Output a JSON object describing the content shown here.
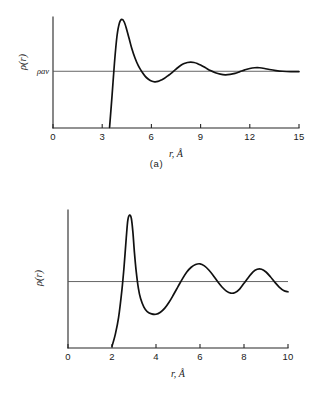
{
  "figure": {
    "panels": [
      {
        "id": "a",
        "caption": "(a)",
        "xlabel": "r, Å",
        "ylabel": "ρ(r)",
        "baseline_label": "ρav",
        "xticks": [
          "0",
          "3",
          "6",
          "9",
          "12",
          "15"
        ]
      },
      {
        "id": "b",
        "caption": "(b)",
        "xlabel": "r, Å",
        "ylabel": "ρ(r)",
        "baseline_label": "",
        "xticks": [
          "0",
          "2",
          "4",
          "6",
          "8",
          "10"
        ]
      }
    ]
  },
  "chart_data": [
    {
      "type": "line",
      "id": "a",
      "title": "",
      "xlabel": "r, Å",
      "ylabel": "ρ(r)",
      "xlim": [
        0,
        15
      ],
      "ylim": [
        -0.62,
        2.55
      ],
      "xticks": [
        0,
        3,
        6,
        9,
        12,
        15
      ],
      "grid": false,
      "legend": null,
      "annotations": [
        {
          "text": "ρav",
          "x": 0,
          "y": 1.0,
          "note": "average density baseline label on y-axis"
        }
      ],
      "baseline_y": 1.0,
      "series": [
        {
          "name": "ρ(r) amorphous",
          "x": [
            3.45,
            3.6,
            3.75,
            3.9,
            4.05,
            4.2,
            4.35,
            4.5,
            4.65,
            4.8,
            5.0,
            5.2,
            5.4,
            5.6,
            5.8,
            6.0,
            6.2,
            6.4,
            6.6,
            6.8,
            7.0,
            7.2,
            7.4,
            7.6,
            7.8,
            8.0,
            8.2,
            8.4,
            8.6,
            8.8,
            9.0,
            9.3,
            9.6,
            9.9,
            10.2,
            10.5,
            10.8,
            11.1,
            11.4,
            11.7,
            12.0,
            12.3,
            12.6,
            12.9,
            13.2,
            13.6,
            14.0,
            14.5,
            15.0
          ],
          "y": [
            -0.6,
            0.3,
            1.25,
            2.0,
            2.38,
            2.48,
            2.4,
            2.18,
            1.92,
            1.66,
            1.38,
            1.16,
            1.0,
            0.87,
            0.78,
            0.72,
            0.7,
            0.71,
            0.75,
            0.8,
            0.87,
            0.94,
            1.02,
            1.1,
            1.17,
            1.22,
            1.25,
            1.26,
            1.25,
            1.22,
            1.18,
            1.1,
            1.02,
            0.96,
            0.92,
            0.9,
            0.91,
            0.94,
            0.99,
            1.04,
            1.08,
            1.1,
            1.1,
            1.08,
            1.05,
            1.02,
            1.0,
            0.99,
            0.99
          ]
        }
      ]
    },
    {
      "type": "line",
      "id": "b",
      "title": "",
      "xlabel": "r, Å",
      "ylabel": "ρ(r)",
      "xlim": [
        0,
        10
      ],
      "ylim": [
        -0.95,
        3.1
      ],
      "xticks": [
        0,
        2,
        4,
        6,
        8,
        10
      ],
      "grid": false,
      "legend": null,
      "annotations": [],
      "baseline_y": 1.0,
      "series": [
        {
          "name": "ρ(r) liquid",
          "x": [
            2.0,
            2.15,
            2.3,
            2.45,
            2.55,
            2.65,
            2.72,
            2.8,
            2.88,
            2.95,
            3.02,
            3.1,
            3.2,
            3.3,
            3.45,
            3.6,
            3.8,
            4.0,
            4.2,
            4.4,
            4.6,
            4.8,
            5.0,
            5.2,
            5.4,
            5.6,
            5.8,
            6.0,
            6.2,
            6.4,
            6.6,
            6.8,
            7.0,
            7.2,
            7.4,
            7.6,
            7.8,
            8.0,
            8.2,
            8.4,
            8.6,
            8.8,
            9.0,
            9.2,
            9.4,
            9.6,
            9.8,
            10.0
          ],
          "y": [
            -0.9,
            -0.55,
            -0.05,
            0.75,
            1.45,
            2.3,
            2.8,
            2.95,
            2.85,
            2.45,
            1.85,
            1.3,
            0.8,
            0.5,
            0.25,
            0.12,
            0.05,
            0.04,
            0.1,
            0.22,
            0.4,
            0.62,
            0.85,
            1.08,
            1.28,
            1.42,
            1.5,
            1.52,
            1.46,
            1.34,
            1.18,
            1.0,
            0.84,
            0.72,
            0.66,
            0.68,
            0.78,
            0.95,
            1.12,
            1.28,
            1.36,
            1.36,
            1.28,
            1.14,
            0.98,
            0.84,
            0.74,
            0.7
          ]
        }
      ]
    }
  ]
}
